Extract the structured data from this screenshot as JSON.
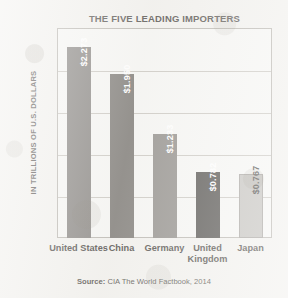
{
  "chart_data": {
    "type": "bar",
    "title": "THE FIVE LEADING IMPORTERS",
    "xlabel": "",
    "ylabel": "IN TRILLIONS OF U.S. DOLLARS",
    "categories": [
      "United States",
      "China",
      "Germany",
      "United Kingdom",
      "Japan"
    ],
    "values": [
      2.273,
      1.95,
      1.233,
      0.782,
      0.767
    ],
    "value_labels": [
      "$2.273",
      "$1.950",
      "$1.233",
      "$0.782",
      "$0.767"
    ],
    "bar_colors": [
      "#878481",
      "#7e7b77",
      "#918e8a",
      "#504e4b",
      "#c3c1bd"
    ],
    "bar_label_colors": [
      "#ffffff",
      "#ffffff",
      "#ffffff",
      "#ffffff",
      "#4a4845"
    ],
    "ylim": [
      0,
      2.5
    ],
    "yticks": [
      0,
      0.5,
      1.0,
      1.5,
      2.0,
      2.5
    ],
    "ytick_labels": [
      "0",
      "0.5",
      "1.0",
      "1.5",
      "2.0",
      "2.5"
    ],
    "grid": true,
    "legend": "none"
  },
  "source": {
    "label": "Source:",
    "text": "CIA The World Factbook, 2014"
  }
}
